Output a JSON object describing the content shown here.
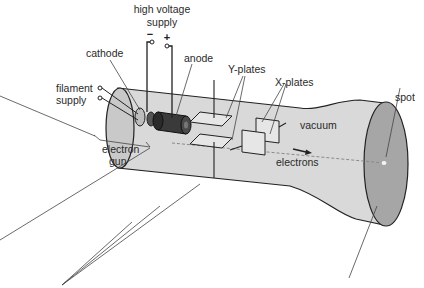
{
  "diagram": {
    "labels": {
      "high_voltage_line1": "high voltage",
      "high_voltage_line2": "supply",
      "minus": "−",
      "plus": "+",
      "cathode": "cathode",
      "anode": "anode",
      "filament_line1": "filament",
      "filament_line2": "supply",
      "electron_gun_line1": "electron",
      "electron_gun_line2": "gun",
      "y_plates": "Y-plates",
      "x_plates": "X-plates",
      "vacuum": "vacuum",
      "electrons": "electrons",
      "spot": "spot"
    },
    "colors": {
      "tube_body": "#d9d9d9",
      "tube_end_left": "#c9c9c9",
      "screen": "#a6a6a6",
      "anode": "#3a3a3a",
      "plates": "#e6e6e6",
      "spot": "#f4f4f4",
      "line": "#222222"
    }
  }
}
